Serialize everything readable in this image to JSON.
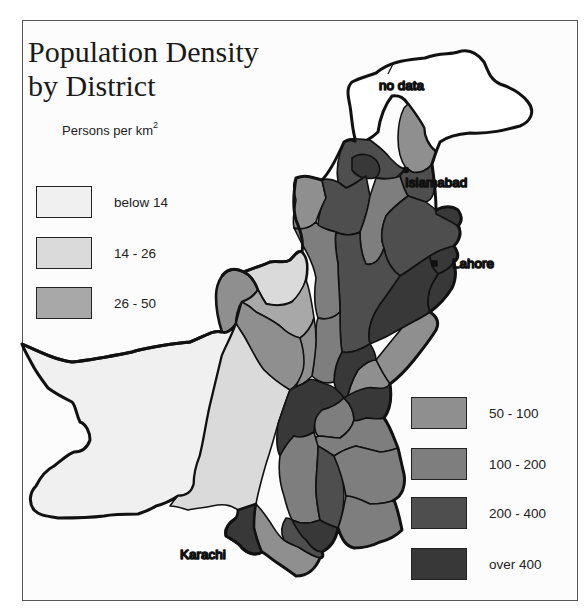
{
  "title_line1": "Population Density",
  "title_line2": "by District",
  "units_label": "Persons per km",
  "units_superscript": "2",
  "legend": [
    {
      "label": "below 14",
      "color": "#f0f0f0"
    },
    {
      "label": "14 - 26",
      "color": "#dadada"
    },
    {
      "label": "26 - 50",
      "color": "#a8a8a8"
    },
    {
      "label": "50 - 100",
      "color": "#8f8f8f"
    },
    {
      "label": "100 - 200",
      "color": "#7e7e7e"
    },
    {
      "label": "200 - 400",
      "color": "#4e4e4e"
    },
    {
      "label": "over 400",
      "color": "#383838"
    }
  ],
  "no_data": {
    "label": "no data",
    "color": "#ffffff"
  },
  "cities": [
    {
      "name": "Islamabad"
    },
    {
      "name": "Lahore"
    },
    {
      "name": "Karachi"
    }
  ]
}
